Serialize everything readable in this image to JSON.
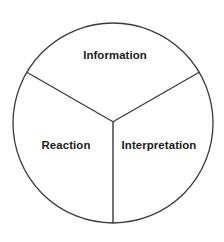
{
  "diagram": {
    "type": "pie",
    "title": "",
    "canvas": {
      "width": 224,
      "height": 242,
      "background": "#ffffff"
    },
    "circle": {
      "center_x": 113,
      "center_y": 123,
      "radius": 100,
      "stroke_color": "#3a3a3a",
      "stroke_width": 1.3,
      "fill_color": "#ffffff"
    },
    "divider": {
      "stroke_color": "#3a3a3a",
      "stroke_width": 1.3
    },
    "label_color": "#1a1a1a",
    "sectors": [
      {
        "id": "information",
        "label": "Information",
        "start_angle_deg": 210,
        "end_angle_deg": 330,
        "sweep_deg": 120,
        "share_percent": 33.3,
        "label_x": 115,
        "label_y": 55
      },
      {
        "id": "interpretation",
        "label": "Interpretation",
        "start_angle_deg": 330,
        "end_angle_deg": 90,
        "sweep_deg": 120,
        "share_percent": 33.3,
        "label_x": 159,
        "label_y": 145
      },
      {
        "id": "reaction",
        "label": "Reaction",
        "start_angle_deg": 90,
        "end_angle_deg": 210,
        "sweep_deg": 120,
        "share_percent": 33.3,
        "label_x": 66,
        "label_y": 145
      }
    ]
  },
  "chart_data": {
    "type": "pie",
    "title": "",
    "subtitle": "",
    "xlabel": "",
    "ylabel": "",
    "grid": false,
    "legend": "none",
    "categories": [
      "Information",
      "Interpretation",
      "Reaction"
    ],
    "values": [
      33.3,
      33.3,
      33.3
    ],
    "units": "percent",
    "annotations": [],
    "tick_labels": []
  }
}
